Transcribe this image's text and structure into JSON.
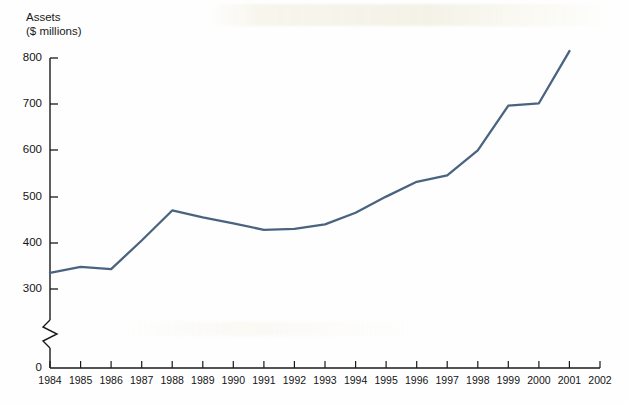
{
  "chart_data": {
    "type": "line",
    "title": "",
    "subtitle": "",
    "xlabel": "",
    "ylabel": "Assets ($ millions)",
    "ylabel_line1": "Assets",
    "ylabel_line2": "($ millions)",
    "grid": false,
    "legend": "none",
    "axis_break": true,
    "axis_break_note": "y-axis broken between 0 and 300",
    "xlim": [
      1984,
      2002
    ],
    "ylim": [
      0,
      800
    ],
    "yticks": [
      0,
      300,
      400,
      500,
      600,
      700,
      800
    ],
    "ytick_labels": [
      "0",
      "300",
      "400",
      "500",
      "600",
      "700",
      "800"
    ],
    "xticks": [
      1984,
      1985,
      1986,
      1987,
      1988,
      1989,
      1990,
      1991,
      1992,
      1993,
      1994,
      1995,
      1996,
      1997,
      1998,
      1999,
      2000,
      2001,
      2002
    ],
    "xtick_labels": [
      "1984",
      "1985",
      "1986",
      "1987",
      "1988",
      "1989",
      "1990",
      "1991",
      "1992",
      "1993",
      "1994",
      "1995",
      "1996",
      "1997",
      "1998",
      "1999",
      "2000",
      "2001",
      "2002"
    ],
    "series": [
      {
        "name": "Assets",
        "color": "#4a6480",
        "x": [
          1984,
          1985,
          1986,
          1987,
          1988,
          1989,
          1990,
          1991,
          1992,
          1993,
          1994,
          1995,
          1996,
          1997,
          1998,
          1999,
          2000,
          2001
        ],
        "values": [
          335,
          348,
          343,
          405,
          470,
          455,
          442,
          428,
          430,
          440,
          465,
          500,
          532,
          546,
          600,
          697,
          702,
          815
        ]
      }
    ]
  },
  "colors": {
    "line": "#4a6480",
    "axis": "#1a1a1a",
    "background": "#fefefe"
  }
}
